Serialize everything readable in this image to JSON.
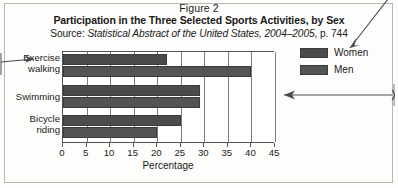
{
  "figure": {
    "number": "Figure 2",
    "title": "Participation in the Three Selected Sports Activities, by Sex",
    "source_prefix": "Source: ",
    "source_italic": "Statistical Abstract of the United States, 2004–2005",
    "source_suffix": ", p. 744"
  },
  "legend": {
    "position": "right",
    "entries": [
      {
        "label": "Women",
        "color": "#4b4b4b"
      },
      {
        "label": "Men",
        "color": "#545454"
      }
    ]
  },
  "axis": {
    "x_title": "Percentage",
    "ticks": [
      "0",
      "5",
      "10",
      "15",
      "20",
      "25",
      "30",
      "35",
      "40",
      "45"
    ]
  },
  "categories_display": [
    {
      "line1": "Exercise",
      "line2": "walking"
    },
    {
      "line1": "Swimming",
      "line2": ""
    },
    {
      "line1": "Bicycle",
      "line2": "riding"
    }
  ],
  "chart_data": {
    "type": "bar",
    "orientation": "horizontal",
    "title": "Participation in the Three Selected Sports Activities, by Sex",
    "subtitle": "Source: Statistical Abstract of the United States, 2004–2005, p. 744",
    "categories": [
      "Exercise walking",
      "Swimming",
      "Bicycle riding"
    ],
    "series": [
      {
        "name": "Women",
        "values": [
          22,
          29,
          25
        ],
        "color": "#4b4b4b"
      },
      {
        "name": "Men",
        "values": [
          40,
          29,
          20
        ],
        "color": "#545454"
      }
    ],
    "xlabel": "Percentage",
    "ylabel": "",
    "xlim": [
      0,
      45
    ],
    "xticks": [
      0,
      5,
      10,
      15,
      20,
      25,
      30,
      35,
      40,
      45
    ],
    "grid": true,
    "legend": "right"
  }
}
